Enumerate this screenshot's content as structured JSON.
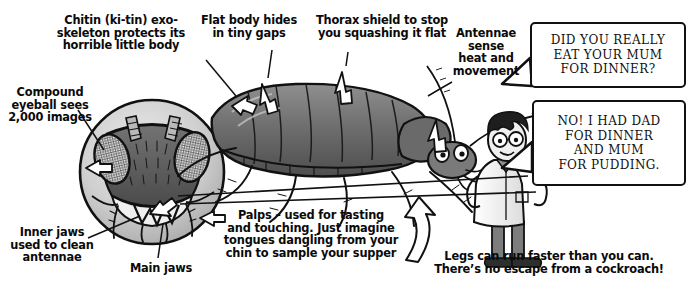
{
  "page": {
    "background": "#ffffff",
    "ink": "#111111"
  },
  "captions": [
    {
      "name": "chitin-exoskeleton",
      "text": "Chitin (ki-tin) exo-\nskeleton protects its\nhorrible little body"
    },
    {
      "name": "flat-body",
      "text": "Flat body hides\nin tiny gaps"
    },
    {
      "name": "thorax-shield",
      "text": "Thorax shield to stop\nyou squashing it flat"
    },
    {
      "name": "antennae-sense",
      "text": "Antennae\nsense\nheat and\nmovement"
    },
    {
      "name": "compound-eyeball",
      "text": "Compound\neyeball sees\n2,000 images"
    },
    {
      "name": "inner-jaws",
      "text": "Inner jaws\nused to clean\nantennae"
    },
    {
      "name": "main-jaws",
      "text": "Main jaws"
    },
    {
      "name": "palps",
      "text": "Palps – used for tasting\nand touching. Just imagine\ntongues dangling from your\nchin to sample your supper"
    },
    {
      "name": "legs-speed",
      "text": "Legs can run faster than you can.\nThere’s no escape from a cockroach!"
    }
  ],
  "speech_bubbles": [
    {
      "name": "scientist-question",
      "text": "DID YOU REALLY\nEAT YOUR MUM\nFOR DINNER?"
    },
    {
      "name": "cockroach-answer",
      "text": "NO! I HAD DAD\nFOR DINNER\nAND MUM\nFOR PUDDING."
    }
  ],
  "artwork": [
    {
      "name": "cockroach-head-magnifier",
      "label": "magnified cockroach head with compound eyes and jaws"
    },
    {
      "name": "cockroach-body",
      "label": "side view of cockroach body with legs and antennae"
    },
    {
      "name": "scientist-character",
      "label": "cartoon scientist in lab coat with glasses"
    }
  ],
  "colors": {
    "ink": "#111111",
    "mid_grey": "#8d8d8d",
    "dark_grey": "#4a4a4a",
    "light_grey": "#d2d2d2",
    "paper": "#ffffff"
  }
}
